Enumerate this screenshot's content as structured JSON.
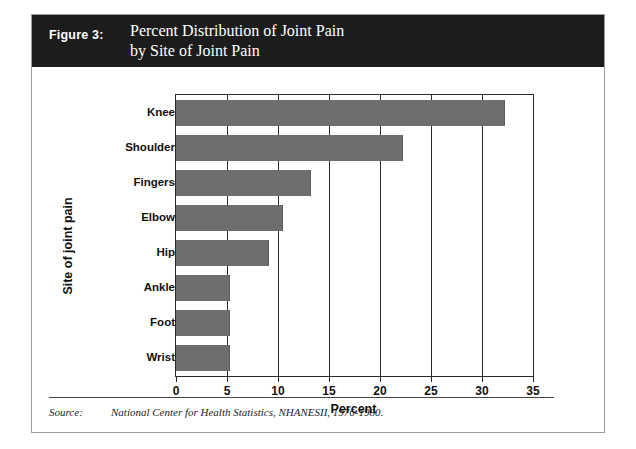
{
  "figure": {
    "number_label": "Figure 3:",
    "title_line1": "Percent Distribution of Joint Pain",
    "title_line2": "by Site of Joint Pain",
    "header_background": "#1c1c1c",
    "header_text_color": "#ffffff"
  },
  "source": {
    "label": "Source:",
    "text": "National Center for Health Statistics, NHANESII, 1976-1980."
  },
  "axes": {
    "x_title": "Percent",
    "y_title": "Site of joint pain",
    "x_ticks": [
      "0",
      "5",
      "10",
      "15",
      "20",
      "25",
      "30",
      "35"
    ]
  },
  "chart_data": {
    "type": "bar",
    "orientation": "horizontal",
    "title": "Percent Distribution of Joint Pain by Site of Joint Pain",
    "xlabel": "Percent",
    "ylabel": "Site of joint pain",
    "xlim": [
      0,
      35
    ],
    "xticks": [
      0,
      5,
      10,
      15,
      20,
      25,
      30,
      35
    ],
    "grid": true,
    "legend": "none",
    "bar_color": "#6e6e6e",
    "categories": [
      "Knee",
      "Shoulder",
      "Fingers",
      "Elbow",
      "Hip",
      "Ankle",
      "Foot",
      "Wrist"
    ],
    "values": [
      32.2,
      22.2,
      13.1,
      10.4,
      9.0,
      5.2,
      5.2,
      5.2
    ]
  }
}
